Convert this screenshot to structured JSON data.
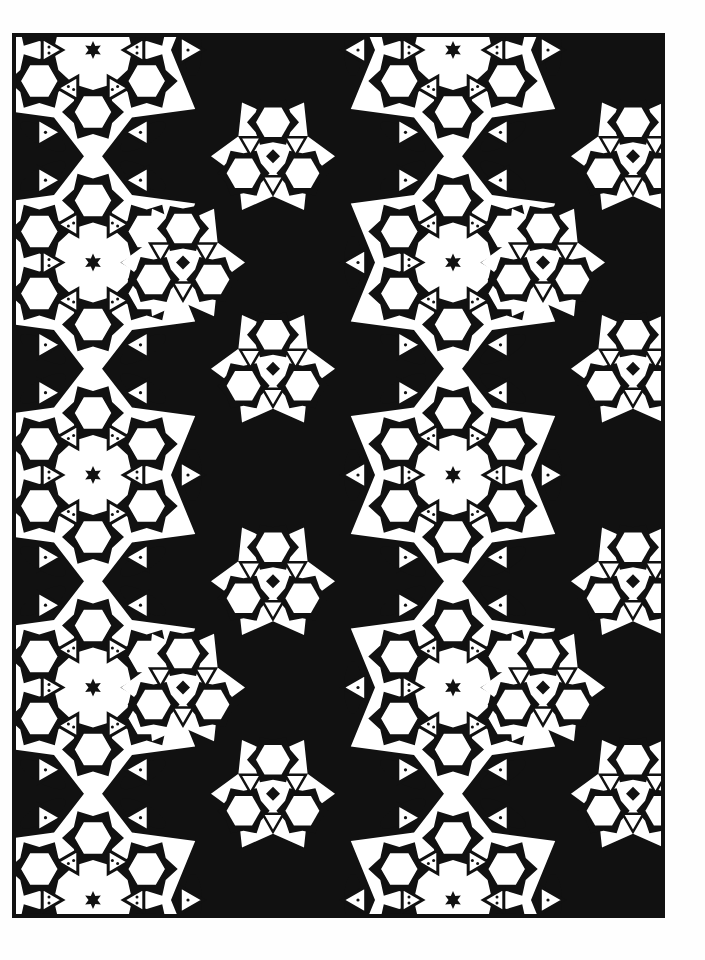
{
  "page": {
    "width": 705,
    "height": 960,
    "background": "#fefefe"
  },
  "artwork": {
    "type": "coloring-page-geometric-tessellation",
    "frame": {
      "x": 12,
      "y": 33,
      "width": 653,
      "height": 885,
      "stroke": "#111111",
      "stroke_width": 4
    },
    "ink_color": "#111111",
    "paper_color": "#ffffff",
    "tile": {
      "period_x": 360,
      "period_y": 425,
      "origin_x": 93,
      "origin_y": 50,
      "offset_x": 180,
      "offset_y": 212.5
    },
    "rosette": {
      "center_star_radius": 9,
      "hexagon_ring_radius": 62,
      "hexagon_radius": 19,
      "hexagon_count": 6,
      "triangle_inner_radius": 44,
      "triangle_outer_radius": 95,
      "triangle_size": 22
    }
  }
}
